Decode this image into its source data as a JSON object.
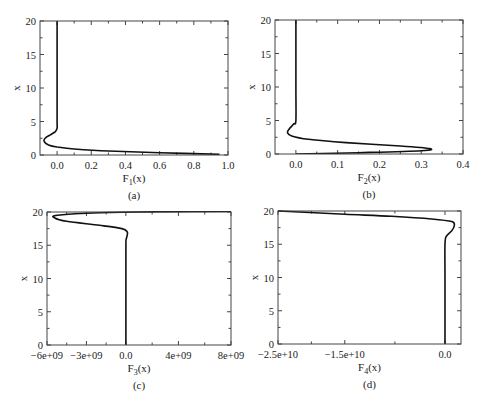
{
  "figure": {
    "panels": [
      {
        "id": "a",
        "caption": "(a)",
        "xlabel_main": "F",
        "xlabel_sub": "1",
        "xlabel_tail": "(x)",
        "ylabel": "x",
        "frame": {
          "left": 40,
          "right": 228,
          "top": 21,
          "bottom": 155
        },
        "xlim": [
          -0.1,
          1.0
        ],
        "ylim": [
          0,
          20
        ],
        "xticks": [
          {
            "v": 0.0,
            "label": "0.0"
          },
          {
            "v": 0.2,
            "label": "0.2"
          },
          {
            "v": 0.4,
            "label": "0.4"
          },
          {
            "v": 0.6,
            "label": "0.6"
          },
          {
            "v": 0.8,
            "label": "0.8"
          },
          {
            "v": 1.0,
            "label": "1.0"
          }
        ],
        "yticks": [
          {
            "v": 0,
            "label": "0"
          },
          {
            "v": 5,
            "label": "5"
          },
          {
            "v": 10,
            "label": "10"
          },
          {
            "v": 15,
            "label": "15"
          },
          {
            "v": 20,
            "label": "20"
          }
        ]
      },
      {
        "id": "b",
        "caption": "(b)",
        "xlabel_main": "F",
        "xlabel_sub": "2",
        "xlabel_tail": "(x)",
        "ylabel": "x",
        "frame": {
          "left": 275,
          "right": 463,
          "top": 20,
          "bottom": 154
        },
        "xlim": [
          -0.05,
          0.4
        ],
        "ylim": [
          0,
          20
        ],
        "xticks": [
          {
            "v": 0.0,
            "label": "0.0"
          },
          {
            "v": 0.1,
            "label": "0.1"
          },
          {
            "v": 0.2,
            "label": "0.2"
          },
          {
            "v": 0.3,
            "label": "0.3"
          },
          {
            "v": 0.4,
            "label": "0.4"
          }
        ],
        "yticks": [
          {
            "v": 0,
            "label": "0"
          },
          {
            "v": 5,
            "label": "5"
          },
          {
            "v": 10,
            "label": "10"
          },
          {
            "v": 15,
            "label": "15"
          },
          {
            "v": 20,
            "label": "20"
          }
        ]
      },
      {
        "id": "c",
        "caption": "(c)",
        "xlabel_main": "F",
        "xlabel_sub": "3",
        "xlabel_tail": "(x)",
        "ylabel": "x",
        "frame": {
          "left": 47,
          "right": 231,
          "top": 212,
          "bottom": 345
        },
        "xlim": [
          -6000000000.0,
          8000000000.0
        ],
        "ylim": [
          0,
          20
        ],
        "xticks": [
          {
            "v": -6000000000.0,
            "label": "−6e+09"
          },
          {
            "v": -3000000000.0,
            "label": "−3e+09"
          },
          {
            "v": 0,
            "label": "0.0"
          },
          {
            "v": 4000000000.0,
            "label": "4e+09"
          },
          {
            "v": 8000000000.0,
            "label": "8e+09"
          }
        ],
        "yticks": [
          {
            "v": 0,
            "label": "0"
          },
          {
            "v": 5,
            "label": "5"
          },
          {
            "v": 10,
            "label": "10"
          },
          {
            "v": 15,
            "label": "15"
          },
          {
            "v": 20,
            "label": "20"
          }
        ]
      },
      {
        "id": "d",
        "caption": "(d)",
        "xlabel_main": "F",
        "xlabel_sub": "4",
        "xlabel_tail": "(x)",
        "ylabel": "x",
        "frame": {
          "left": 278,
          "right": 461,
          "top": 211,
          "bottom": 344
        },
        "xlim": [
          -25000000000.0,
          2400000000.0
        ],
        "ylim": [
          0,
          20
        ],
        "xticks": [
          {
            "v": -25000000000.0,
            "label": "−2.5e+10"
          },
          {
            "v": -15000000000.0,
            "label": "−1.5e+10"
          },
          {
            "v": 0,
            "label": "0.0"
          }
        ],
        "yticks": [
          {
            "v": 0,
            "label": "0"
          },
          {
            "v": 5,
            "label": "5"
          },
          {
            "v": 10,
            "label": "10"
          },
          {
            "v": 15,
            "label": "15"
          },
          {
            "v": 20,
            "label": "20"
          }
        ]
      }
    ]
  },
  "chart_data": [
    {
      "type": "line",
      "title": "(a)",
      "xlabel": "F1(x)",
      "ylabel": "x",
      "xlim": [
        -0.1,
        1.0
      ],
      "ylim": [
        0,
        20
      ],
      "grid": false,
      "series": [
        {
          "name": "F1(x)",
          "x": [
            0.95,
            0.6,
            0.3,
            0.1,
            0.0,
            -0.05,
            -0.075,
            -0.07,
            -0.04,
            -0.01,
            0.0,
            0.0,
            0.0,
            0.0
          ],
          "y": [
            0.1,
            0.35,
            0.6,
            0.9,
            1.2,
            1.5,
            2.0,
            2.5,
            3.0,
            3.5,
            4.0,
            5.0,
            10.0,
            20.0
          ]
        }
      ]
    },
    {
      "type": "line",
      "title": "(b)",
      "xlabel": "F2(x)",
      "ylabel": "x",
      "xlim": [
        -0.05,
        0.4
      ],
      "ylim": [
        0,
        20
      ],
      "grid": false,
      "series": [
        {
          "name": "F2(x)",
          "x": [
            0.0,
            0.15,
            0.3,
            0.32,
            0.25,
            0.12,
            0.03,
            -0.01,
            -0.02,
            -0.015,
            -0.005,
            0.0,
            0.0,
            0.0
          ],
          "y": [
            0.0,
            0.2,
            0.5,
            0.8,
            1.2,
            1.7,
            2.2,
            2.7,
            3.2,
            3.8,
            4.5,
            5.0,
            10.0,
            20.0
          ]
        }
      ]
    },
    {
      "type": "line",
      "title": "(c)",
      "xlabel": "F3(x)",
      "ylabel": "x",
      "xlim": [
        -6000000000.0,
        8000000000.0
      ],
      "ylim": [
        0,
        20
      ],
      "grid": false,
      "series": [
        {
          "name": "F3(x)",
          "x": [
            0,
            0,
            0,
            20000000.0,
            100000000.0,
            100000000.0,
            -300000000.0,
            -2000000000.0,
            -4500000000.0,
            -5400000000.0,
            -5200000000.0,
            -2000000000.0,
            3000000000.0,
            8000000000.0
          ],
          "y": [
            0,
            10,
            15,
            15.8,
            16.5,
            17.0,
            17.5,
            18.0,
            18.6,
            19.1,
            19.5,
            19.9,
            20.05,
            20.1
          ]
        }
      ]
    },
    {
      "type": "line",
      "title": "(d)",
      "xlabel": "F4(x)",
      "ylabel": "x",
      "xlim": [
        -25000000000.0,
        2400000000.0
      ],
      "ylim": [
        0,
        20
      ],
      "grid": false,
      "series": [
        {
          "name": "F4(x)",
          "x": [
            0,
            0,
            0,
            200000000.0,
            1000000000.0,
            1400000000.0,
            1000000000.0,
            -2000000000.0,
            -8000000000.0,
            -15000000000.0,
            -21000000000.0,
            -25000000000.0
          ],
          "y": [
            0,
            10,
            15,
            16.2,
            17.0,
            17.8,
            18.4,
            18.8,
            19.2,
            19.5,
            19.8,
            20.0
          ]
        }
      ]
    }
  ]
}
